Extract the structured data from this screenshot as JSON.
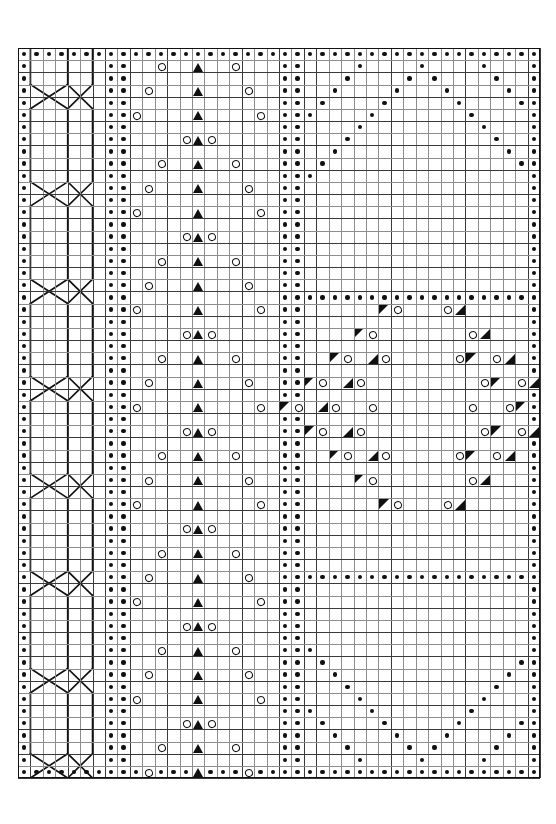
{
  "chart": {
    "type": "stitch-chart-grid",
    "columns": 42,
    "rows": 60,
    "cell_px": 12.43,
    "origin": {
      "x": 18,
      "y": 48
    },
    "colors": {
      "background": "#ffffff",
      "minor_grid": "#8d8d8d",
      "major_grid": "#3a3a3a",
      "border": "#111111",
      "symbol": "#101010"
    },
    "legend": [
      {
        "key": "purl",
        "glyph": "•",
        "name": "purl-stitch"
      },
      {
        "key": "yo",
        "glyph": "o",
        "name": "yarn-over"
      },
      {
        "key": "cdd",
        "glyph": "▲",
        "name": "centered-double-decrease"
      },
      {
        "key": "k2tog",
        "glyph": "◣",
        "name": "knit-two-together-right-triangle"
      },
      {
        "key": "ssk",
        "glyph": "◢",
        "name": "slip-slip-knit-left-triangle"
      },
      {
        "key": "cable",
        "glyph": "⤬",
        "name": "cable-cross"
      }
    ],
    "panels": [
      {
        "name": "left-purl-edge",
        "col_start": 0,
        "col_end": 0
      },
      {
        "name": "cable-panel",
        "col_start": 1,
        "col_end": 6
      },
      {
        "name": "purl-divider-a",
        "col_start": 7,
        "col_end": 8
      },
      {
        "name": "lace-chevron-panel",
        "col_start": 9,
        "col_end": 20
      },
      {
        "name": "purl-divider-b",
        "col_start": 21,
        "col_end": 22
      },
      {
        "name": "diamond-panel",
        "col_start": 23,
        "col_end": 40
      },
      {
        "name": "right-purl-edge",
        "col_start": 41,
        "col_end": 41
      }
    ]
  },
  "chart_data": {
    "type": "heatmap",
    "xlabel": "stitch column",
    "ylabel": "row",
    "grid": true,
    "legend_position": "none",
    "x": [
      0,
      1,
      2,
      3,
      4,
      5,
      6,
      7,
      8,
      9,
      10,
      11,
      12,
      13,
      14,
      15,
      16,
      17,
      18,
      19,
      20,
      21,
      22,
      23,
      24,
      25,
      26,
      27,
      28,
      29,
      30,
      31,
      32,
      33,
      34,
      35,
      36,
      37,
      38,
      39,
      40,
      41
    ],
    "symbol_codes": {
      "0": "blank",
      "1": "purl",
      "2": "yo",
      "3": "cdd",
      "4": "k2tog",
      "5": "ssk"
    },
    "purl_top_row": [
      0,
      1,
      2,
      3,
      4,
      5,
      6,
      7,
      8,
      9,
      10,
      11,
      12,
      13,
      14,
      15,
      16,
      17,
      18,
      19,
      20,
      21,
      22,
      23,
      24,
      25,
      26,
      27,
      28,
      29,
      30,
      31,
      32,
      33,
      34,
      35,
      36,
      37,
      38,
      39,
      40,
      41
    ],
    "purl_bottom_row": [
      0,
      1,
      2,
      3,
      4,
      5,
      6,
      7,
      8,
      9,
      10,
      11,
      12,
      13,
      14,
      15,
      16,
      17,
      18,
      19,
      20,
      21,
      22,
      23,
      24,
      25,
      26,
      27,
      28,
      29,
      30,
      31,
      32,
      33,
      34,
      35,
      36,
      37,
      38,
      39,
      40,
      41
    ],
    "purl_left_col": 0,
    "purl_right_col": 41,
    "purl_divider_cols": [
      7,
      8,
      21,
      22
    ],
    "cable_panel": {
      "col_start": 1,
      "col_end": 6,
      "left_rail_col": 1,
      "mid_rail_col": 4,
      "right_rail_col": 6,
      "cross_rows": [
        3,
        11,
        19,
        27,
        35,
        43,
        51,
        58
      ],
      "cross_note": "two X crossings per cross-row: left pair cols 1-4, right pair cols 4-6"
    },
    "lace_panel": {
      "col_start": 9,
      "col_end": 20,
      "center_col": 14,
      "cdd_rows": [
        1,
        3,
        5,
        7,
        9,
        11,
        13,
        15,
        17,
        19,
        21,
        23,
        25,
        27,
        29,
        31,
        33,
        35,
        37,
        39,
        41,
        43,
        45,
        47,
        49,
        51,
        53,
        55,
        57,
        59
      ],
      "yo_offset_cycle": [
        3,
        4,
        5,
        1,
        3,
        4,
        5,
        1
      ],
      "yo_pairs_note": "on each cdd row a yarn-over sits symmetrically left and right of the centre column at the cycling offset"
    },
    "diamond_panel": {
      "col_start": 23,
      "col_end": 40,
      "center_col": 32,
      "upper_diamond_purls_rows": [
        1,
        2,
        3,
        4,
        5,
        6,
        7,
        8,
        9,
        10,
        11,
        12,
        13,
        14,
        15,
        16,
        17,
        18,
        19
      ],
      "purl_band_rows": [
        20,
        43
      ],
      "lower_diamond_purls_rows": [
        44,
        45,
        46,
        47,
        48,
        49,
        50,
        51,
        52,
        53,
        54,
        55,
        56,
        57,
        58
      ],
      "motif_rows": [
        21,
        22,
        23,
        24,
        25,
        26,
        27,
        28,
        29,
        30,
        31,
        32,
        33,
        34,
        35,
        36,
        37,
        38,
        39,
        40,
        41,
        42
      ],
      "motif_note": "central leaf/diamond of k2tog and ssk triangles flanking yarn-overs"
    }
  }
}
